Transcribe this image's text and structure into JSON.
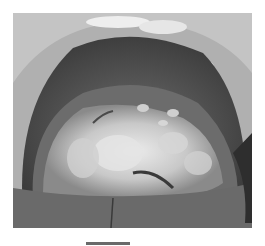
{
  "image": {
    "subject": "clinical photograph of open mouth showing dorsal tongue with white plaque-like lesions",
    "palette": {
      "background": "#ffffff",
      "lips": "#b5b5b5",
      "oral_dark": "#3e3e3e",
      "tongue": "#6f6f6f",
      "lesion_white": "#e2e2e2",
      "lesion_mid": "#bdbdbd",
      "teeth": "#eeeeee",
      "lower_lip": "#6a6a6a"
    }
  },
  "scale_bar": {
    "visible": true,
    "color": "#6a6a6a"
  }
}
